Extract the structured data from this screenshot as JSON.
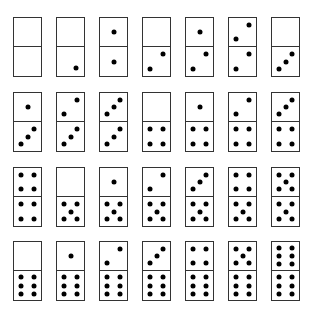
{
  "layout": {
    "x0": 13,
    "dx": 43,
    "rows_y": [
      17,
      92,
      167,
      241
    ]
  },
  "rows": [
    [
      [
        0,
        0
      ],
      [
        0,
        1
      ],
      [
        1,
        1
      ],
      [
        0,
        2
      ],
      [
        1,
        2
      ],
      [
        2,
        2
      ],
      [
        0,
        3
      ]
    ],
    [
      [
        1,
        3
      ],
      [
        2,
        3
      ],
      [
        3,
        3
      ],
      [
        0,
        4
      ],
      [
        1,
        4
      ],
      [
        2,
        4
      ],
      [
        3,
        4
      ]
    ],
    [
      [
        4,
        4
      ],
      [
        0,
        5
      ],
      [
        1,
        5
      ],
      [
        2,
        5
      ],
      [
        3,
        5
      ],
      [
        4,
        5
      ],
      [
        5,
        5
      ]
    ],
    [
      [
        0,
        6
      ],
      [
        1,
        6
      ],
      [
        2,
        6
      ],
      [
        3,
        6
      ],
      [
        4,
        6
      ],
      [
        5,
        6
      ],
      [
        6,
        6
      ]
    ]
  ],
  "colors": {
    "pip": "#000000",
    "border": "#333333"
  }
}
